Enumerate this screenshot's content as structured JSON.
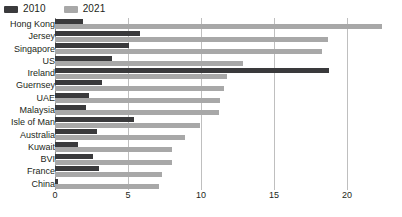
{
  "legend": {
    "position": "top-left",
    "items": [
      {
        "label": "2010",
        "color": "#3a3a3c",
        "name": "legend-2010"
      },
      {
        "label": "2021",
        "color": "#a8a8a8",
        "name": "legend-2021"
      }
    ]
  },
  "axis": {
    "ticks": [
      "0",
      "5",
      "10",
      "15",
      "20"
    ],
    "tick_values": [
      0,
      5,
      10,
      15,
      20
    ],
    "min": 0,
    "max": 22.5,
    "grid": true
  },
  "chart_data": {
    "type": "bar",
    "orientation": "horizontal",
    "title": "",
    "subtitle": "",
    "xlabel": "",
    "ylabel": "",
    "xlim": [
      0,
      22.5
    ],
    "grid": true,
    "legend_position": "top-left",
    "categories": [
      "Hong Kong",
      "Jersey",
      "Singapore",
      "US",
      "Ireland",
      "Guernsey",
      "UAE",
      "Malaysia",
      "Isle of Man",
      "Australia",
      "Kuwait",
      "BVI",
      "France",
      "China"
    ],
    "series": [
      {
        "name": "2010",
        "color": "#3a3a3c",
        "values": [
          1.9,
          5.8,
          5.1,
          3.9,
          18.8,
          3.2,
          2.3,
          2.1,
          5.4,
          2.9,
          1.6,
          2.6,
          3.0,
          0.2
        ]
      },
      {
        "name": "2021",
        "color": "#a8a8a8",
        "values": [
          22.4,
          18.7,
          18.3,
          12.9,
          11.8,
          11.6,
          11.3,
          11.2,
          9.9,
          8.9,
          8.0,
          8.0,
          7.3,
          7.1
        ]
      }
    ]
  }
}
